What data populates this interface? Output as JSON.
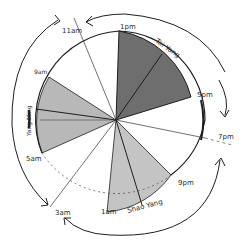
{
  "diagram": {
    "type": "clock-wheel",
    "center": [
      116,
      120
    ],
    "radius": 89,
    "colors": {
      "background": "#ffffff",
      "ink": "#1e1e1e",
      "tai_yang_fill": "#6e6e6e",
      "yang_ming_fill": "#b8b8b8",
      "shao_yang_fill": "#c4c4c4"
    },
    "time_labels": {
      "t11am": "11am",
      "t1pm": "1pm",
      "t5pm": "5pm",
      "t7pm": "7pm",
      "t9pm": "9pm",
      "t1am": "1am",
      "t3am": "3am",
      "t5am": "5am",
      "t9am": "9am"
    },
    "sectors": [
      {
        "name": "Tai Yang",
        "from": "1pm",
        "to": "5pm",
        "shade": "dark"
      },
      {
        "name": "Yang Ming",
        "from": "5am",
        "to": "9am",
        "shade": "light"
      },
      {
        "name": "Shao Yang",
        "from": "9pm",
        "to": "1am",
        "shade": "light"
      }
    ],
    "sector_labels": {
      "tai_yang": "Tai Yang",
      "yang_ming": "Yang Ming",
      "shao_yang": "Shao Yang"
    },
    "arrows": [
      {
        "from": "1pm",
        "to": "11am",
        "direction": "counter-clockwise",
        "position": "top"
      },
      {
        "from": "11am",
        "to": "3am",
        "direction": "counter-clockwise",
        "position": "left"
      },
      {
        "from": "7pm",
        "to": "3am",
        "direction": "clockwise",
        "position": "bottom"
      },
      {
        "from": "1pm",
        "to": "7pm",
        "direction": "clockwise",
        "position": "right"
      }
    ]
  }
}
